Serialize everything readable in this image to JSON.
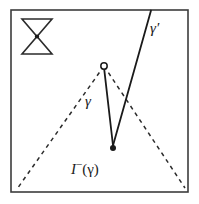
{
  "figure": {
    "caption_type": "causal-structure-diagram",
    "frame": {
      "x": 11,
      "y": 10,
      "width": 177,
      "height": 182,
      "stroke_color": "#3c3c3c",
      "stroke_width": 1.6,
      "fill_color": "#ffffff"
    },
    "icon": {
      "name": "light-cone-bowtie-icon",
      "x": 22,
      "y": 19,
      "width": 30,
      "height": 35,
      "stroke_color": "#2b2b2b",
      "description": "hourglass bowtie of two triangles meeting at a filled center point"
    },
    "points": [
      {
        "name": "apex-point",
        "style": "hollow-circle",
        "x": 104,
        "y": 66,
        "radius": 3.2,
        "stroke_color": "#1a1a1a",
        "fill_color": "#ffffff"
      },
      {
        "name": "kink-point",
        "style": "filled-dot",
        "x": 113,
        "y": 148,
        "radius": 3.0,
        "fill_color": "#1a1a1a"
      }
    ],
    "dashed_curves": [
      {
        "name": "past-light-cone-left",
        "from": [
          104,
          66
        ],
        "to": [
          17,
          189
        ],
        "dash": "4 4",
        "stroke_color": "#2b2b2b",
        "stroke_width": 1.5
      },
      {
        "name": "past-light-cone-right",
        "from": [
          104,
          66
        ],
        "to": [
          185,
          188
        ],
        "dash": "4 4",
        "stroke_color": "#2b2b2b",
        "stroke_width": 1.5
      }
    ],
    "solid_curves": [
      {
        "name": "gamma-descending-segment",
        "from": [
          104,
          69
        ],
        "to": [
          113,
          145
        ],
        "stroke_color": "#1a1a1a",
        "stroke_width": 1.8
      },
      {
        "name": "gamma-prime-ascending-segment",
        "from": [
          113,
          145
        ],
        "to": [
          151,
          11
        ],
        "stroke_color": "#1a1a1a",
        "stroke_width": 1.8
      }
    ],
    "labels": {
      "gamma_prime": "γ′",
      "gamma": "γ",
      "past_domain_italic": "I",
      "past_domain_superscript": "−",
      "past_domain_argument": "(γ)"
    },
    "colors": {
      "background": "#ffffff",
      "ink": "#1a1a1a",
      "frame": "#3c3c3c",
      "dashed": "#2b2b2b"
    }
  }
}
